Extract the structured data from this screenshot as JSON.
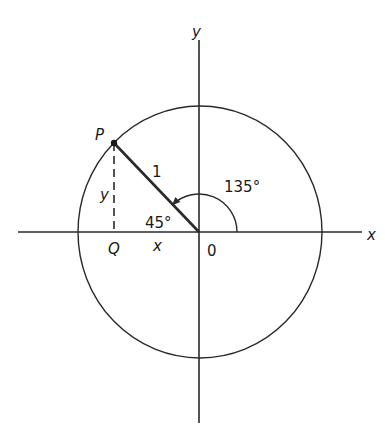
{
  "diagram": {
    "type": "unit-circle",
    "labels": {
      "y_axis": "y",
      "x_axis": "x",
      "point_p": "P",
      "point_q": "Q",
      "origin": "0",
      "radius": "1",
      "leg_y": "y",
      "leg_x": "x",
      "reference_angle": "45°",
      "angle": "135°"
    },
    "angle_degrees": 135,
    "reference_angle_degrees": 45,
    "radius_value": 1,
    "colors": {
      "ink": "#2a2a2a",
      "background": "#ffffff"
    }
  }
}
